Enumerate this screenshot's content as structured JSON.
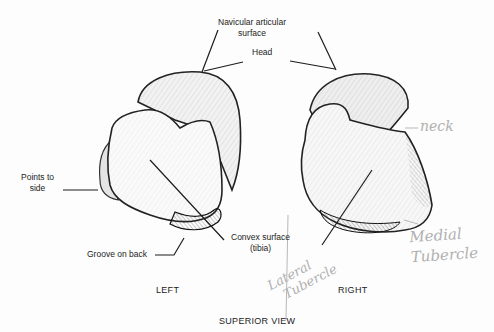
{
  "figure": {
    "title": "SUPERIOR VIEW",
    "colors": {
      "ink": "#1c1c1c",
      "pencil": "#b0b0b0",
      "background": "#fdfdfd"
    }
  },
  "labels": {
    "navicular": "Navicular articular\nsurface",
    "navicular_line1": "Navicular articular",
    "navicular_line2": "surface",
    "head": "Head",
    "points_to_side_line1": "Points to",
    "points_to_side_line2": "side",
    "groove": "Groove on back",
    "convex_line1": "Convex surface",
    "convex_line2": "(tibia)"
  },
  "captions": {
    "left": "LEFT",
    "right": "RIGHT",
    "view": "SUPERIOR VIEW"
  },
  "handwritten": {
    "neck": "neck",
    "medial_line1": "Medial",
    "medial_line2": "Tubercle",
    "lateral_line1": "Lateral",
    "lateral_line2": "Tubercle"
  }
}
